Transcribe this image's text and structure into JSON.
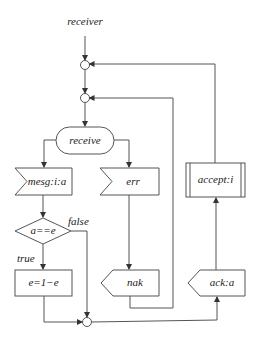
{
  "diagram": {
    "title": "receiver",
    "nodes": {
      "receive": "receive",
      "mesg": "mesg:i:a",
      "err": "err",
      "decision": "a==e",
      "assign": "e=1−e",
      "nak": "nak",
      "ack": "ack:a",
      "accept": "accept:i"
    },
    "edge_labels": {
      "false": "false",
      "true": "true"
    },
    "colors": {
      "stroke": "#555555",
      "text": "#222222",
      "background": "#ffffff"
    }
  }
}
